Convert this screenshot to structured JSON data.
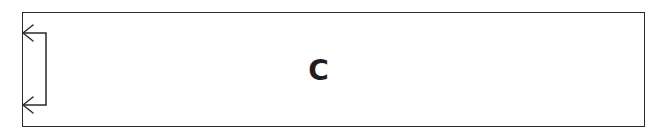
{
  "diagram": {
    "block_label": "C",
    "stroke_color": "#2a2a2a",
    "background_color": "#ffffff",
    "feedback_loop": {
      "description": "self-loop arrow on left side of block",
      "arrowheads": 2
    }
  }
}
